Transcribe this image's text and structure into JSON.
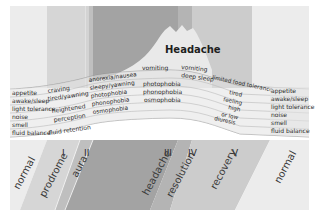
{
  "title": "Headache",
  "colors": {
    "background": "#ffffff",
    "normal_left": "#ececec",
    "prodrome": "#d6d6d6",
    "aura": "#bfbfbf",
    "headache": "#a3a3a3",
    "resolution": "#b4b4b4",
    "recovery": "#cccccc",
    "normal_right": "#ececec",
    "headache_peak": "#e9e9e9",
    "band": "#dedede",
    "band_line": "#8a8a8a",
    "text": "#2a2a2a"
  },
  "phases": [
    {
      "id": "normal-left",
      "label": "normal",
      "numeral": ""
    },
    {
      "id": "prodrome",
      "label": "prodrome",
      "numeral": "I"
    },
    {
      "id": "aura",
      "label": "aura",
      "numeral": "II"
    },
    {
      "id": "headache",
      "label": "headache",
      "numeral": "III"
    },
    {
      "id": "resolution",
      "label": "resolution",
      "numeral": "IV"
    },
    {
      "id": "recovery",
      "label": "recovery",
      "numeral": "V"
    },
    {
      "id": "normal-right",
      "label": "normal",
      "numeral": ""
    }
  ],
  "functions_left": [
    "appetite",
    "awake/sleep",
    "light tolerance",
    "noise",
    "smell",
    "fluid balance"
  ],
  "functions_right": [
    "appetite",
    "awake/sleep",
    "light tolerance",
    "noise",
    "smell",
    "fluid balance"
  ],
  "symptoms": {
    "prodrome": [
      "craving",
      "tired/yawning",
      "heightened",
      "perception",
      "fluid retention"
    ],
    "aura": [
      "anorexia/nausea",
      "sleepy/yawning",
      "photophobia",
      "phonophobia",
      "osmophobia"
    ],
    "headache": [
      "vomiting",
      "photophobia",
      "phonophobia",
      "osmophobia"
    ],
    "resolution": [
      "vomiting",
      "deep sleep"
    ],
    "recovery": [
      "limited food tolerance",
      "tired",
      "feeling",
      "high",
      "or low",
      "diuresis"
    ]
  }
}
